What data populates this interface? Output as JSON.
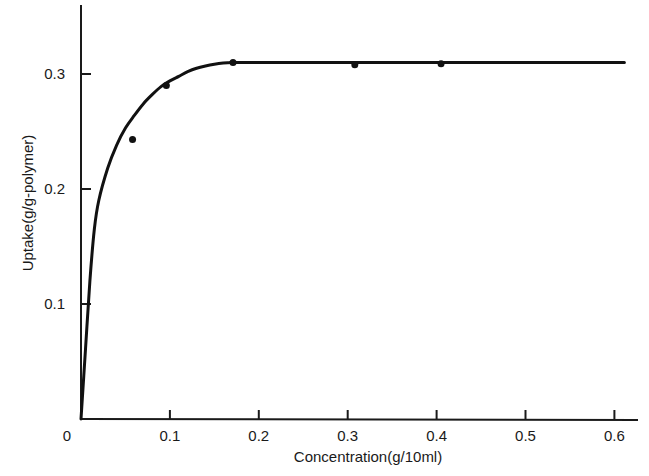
{
  "chart_data": {
    "type": "scatter",
    "title": "",
    "xlabel": "Concentration(g/10ml)",
    "ylabel": "Uptake(g/g-polymer)",
    "xlim": [
      0,
      0.62
    ],
    "ylim": [
      0,
      0.36
    ],
    "grid": false,
    "legend": "none",
    "x_ticks": [
      {
        "value": 0,
        "label": "0"
      },
      {
        "value": 0.1,
        "label": "0.1"
      },
      {
        "value": 0.2,
        "label": "0.2"
      },
      {
        "value": 0.3,
        "label": "0.3"
      },
      {
        "value": 0.4,
        "label": "0.4"
      },
      {
        "value": 0.5,
        "label": "0.5"
      },
      {
        "value": 0.6,
        "label": "0.6"
      }
    ],
    "y_ticks": [
      {
        "value": 0.1,
        "label": "0.1"
      },
      {
        "value": 0.2,
        "label": "0.2"
      },
      {
        "value": 0.3,
        "label": "0.3"
      }
    ],
    "series": [
      {
        "name": "measured",
        "kind": "points",
        "x": [
          0.058,
          0.096,
          0.171,
          0.308,
          0.405
        ],
        "y": [
          0.243,
          0.29,
          0.31,
          0.308,
          0.309
        ]
      },
      {
        "name": "fitted curve",
        "kind": "line",
        "x": [
          0,
          0.005,
          0.01,
          0.015,
          0.02,
          0.03,
          0.04,
          0.05,
          0.06,
          0.07,
          0.08,
          0.09,
          0.1,
          0.11,
          0.12,
          0.13,
          0.14,
          0.15,
          0.16,
          0.17,
          0.18,
          0.3,
          0.4,
          0.5,
          0.6,
          0.61
        ],
        "y": [
          0,
          0.06,
          0.12,
          0.165,
          0.19,
          0.218,
          0.238,
          0.253,
          0.264,
          0.274,
          0.282,
          0.289,
          0.294,
          0.298,
          0.302,
          0.305,
          0.307,
          0.3085,
          0.3095,
          0.31,
          0.31,
          0.31,
          0.31,
          0.31,
          0.31,
          0.31
        ]
      }
    ]
  }
}
